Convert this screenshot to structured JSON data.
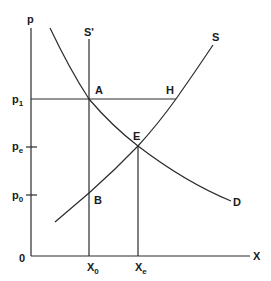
{
  "diagram": {
    "type": "supply-demand",
    "axes": {
      "y_label": "p",
      "x_label": "X",
      "origin_label": "0"
    },
    "price_ticks": [
      {
        "base": "p",
        "sub": "1"
      },
      {
        "base": "p",
        "sub": "e"
      },
      {
        "base": "p",
        "sub": "0"
      }
    ],
    "quantity_ticks": [
      {
        "base": "X",
        "sub": "0"
      },
      {
        "base": "X",
        "sub": "e"
      }
    ],
    "curves": {
      "supply": "S",
      "supply_fixed": "S'",
      "demand": "D"
    },
    "points": {
      "A": "A",
      "H": "H",
      "E": "E",
      "B": "B"
    }
  }
}
